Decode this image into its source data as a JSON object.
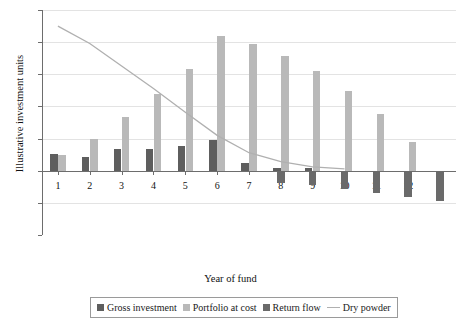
{
  "chart_data": {
    "type": "bar",
    "title": "",
    "xlabel": "Year of fund",
    "ylabel": "Illustrative investment units",
    "categories": [
      "1",
      "2",
      "3",
      "4",
      "5",
      "6",
      "7",
      "8",
      "9",
      "10",
      "11",
      "12",
      ""
    ],
    "ylim": [
      -100,
      250
    ],
    "yticks": [
      -100,
      -50,
      0,
      50,
      100,
      150,
      200,
      250
    ],
    "grid": true,
    "legend_position": "bottom",
    "series": [
      {
        "name": "Gross investment",
        "type": "bar",
        "color": "#5e5e5e",
        "values": [
          26,
          22,
          34,
          34,
          39,
          48,
          12,
          5,
          4,
          0,
          0,
          0,
          0
        ]
      },
      {
        "name": "Portfolio at cost",
        "type": "bar",
        "color": "#b9b9b9",
        "values": [
          24,
          50,
          84,
          119,
          159,
          210,
          197,
          179,
          155,
          124,
          88,
          45,
          0
        ]
      },
      {
        "name": "Return flow",
        "type": "bar",
        "color": "#6a6a6a",
        "values": [
          0,
          0,
          0,
          0,
          0,
          0,
          0,
          -19,
          -22,
          -29,
          -34,
          -41,
          -47
        ]
      },
      {
        "name": "Dry powder",
        "type": "line",
        "color": "#b0b0b0",
        "values": [
          225,
          198,
          163,
          128,
          91,
          55,
          28,
          14,
          6,
          3,
          null,
          null,
          null
        ]
      }
    ]
  },
  "legend": {
    "items": [
      {
        "label": "Gross investment",
        "marker": "square",
        "color": "#5e5e5e"
      },
      {
        "label": "Portfolio at cost",
        "marker": "square",
        "color": "#b9b9b9"
      },
      {
        "label": "Return flow",
        "marker": "square",
        "color": "#6a6a6a"
      },
      {
        "label": "Dry powder",
        "marker": "line",
        "color": "#b0b0b0"
      }
    ]
  }
}
